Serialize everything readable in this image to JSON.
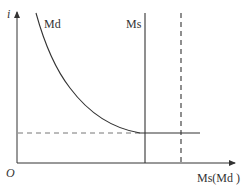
{
  "diagram": {
    "type": "phase-stability schematic",
    "axes": {
      "y_label": "i",
      "x_label": "Ms(Md )",
      "origin_label": "O"
    },
    "curves": [
      {
        "name": "Md",
        "label": "Md",
        "style": "solid",
        "kind": "decaying curve"
      },
      {
        "name": "Ms",
        "label": "Ms",
        "style": "solid",
        "kind": "vertical line"
      },
      {
        "name": "right-bound",
        "label": "",
        "style": "dashed",
        "kind": "vertical line"
      },
      {
        "name": "asymptote",
        "label": "",
        "style": "dashed",
        "kind": "horizontal line"
      }
    ],
    "colors": {
      "line": "#333333",
      "dashed": "#666666",
      "background": "#ffffff"
    }
  }
}
